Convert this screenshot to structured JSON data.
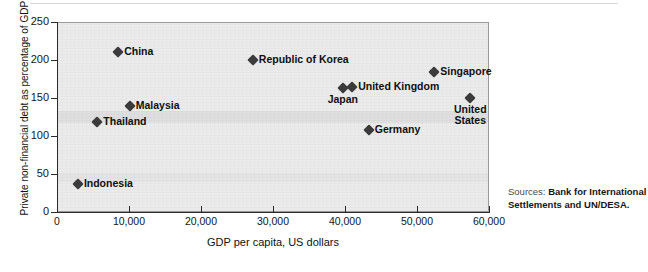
{
  "chart_data": {
    "type": "scatter",
    "title": "",
    "xlabel": "GDP per capita, US dollars",
    "ylabel": "Private non-financial debt as percentage of GDP",
    "xlim": [
      0,
      60000
    ],
    "ylim": [
      0,
      250
    ],
    "xticks": [
      "0",
      "10,000",
      "20,000",
      "30,000",
      "40,000",
      "50,000",
      "60,000"
    ],
    "xtick_values": [
      0,
      10000,
      20000,
      30000,
      40000,
      50000,
      60000
    ],
    "yticks": [
      "0",
      "50",
      "100",
      "150",
      "200",
      "250"
    ],
    "ytick_values": [
      0,
      50,
      100,
      150,
      200,
      250
    ],
    "grid": false,
    "legend": "none",
    "points": [
      {
        "label": "Indonesia",
        "x": 2900,
        "y": 37,
        "label_pos": "right"
      },
      {
        "label": "Thailand",
        "x": 5600,
        "y": 119,
        "label_pos": "right"
      },
      {
        "label": "China",
        "x": 8500,
        "y": 211,
        "label_pos": "right"
      },
      {
        "label": "Malaysia",
        "x": 10100,
        "y": 139,
        "label_pos": "right"
      },
      {
        "label": "Republic of Korea",
        "x": 27200,
        "y": 200,
        "label_pos": "right"
      },
      {
        "label": "Japan",
        "x": 39700,
        "y": 163,
        "label_pos": "below"
      },
      {
        "label": "United Kingdom",
        "x": 41000,
        "y": 164,
        "label_pos": "right"
      },
      {
        "label": "Germany",
        "x": 43300,
        "y": 108,
        "label_pos": "right"
      },
      {
        "label": "Singapore",
        "x": 52400,
        "y": 184,
        "label_pos": "right"
      },
      {
        "label": "United\nStates",
        "x": 57400,
        "y": 150,
        "label_pos": "below"
      }
    ]
  },
  "source": {
    "prefix": "Sources:",
    "text": "Bank for International Settlements and UN/DESA."
  },
  "colors": {
    "marker": "#3b3b3b",
    "plot_background": "#ebebeb",
    "plot_border": "#9a9a9a",
    "axis": "#2b2b2b",
    "text": "#101010"
  }
}
